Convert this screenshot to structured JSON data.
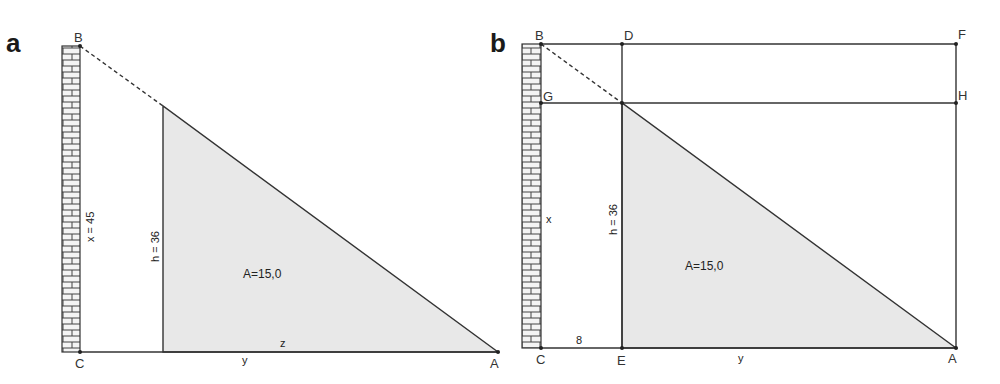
{
  "colors": {
    "background": "#ffffff",
    "line": "#333333",
    "shade": "#e8e8e8",
    "brick_fill": "#f4f4f4"
  },
  "panel_a": {
    "label": "a",
    "points": {
      "B": "B",
      "C": "C",
      "A": "A"
    },
    "dimensions": {
      "wall_height": "x = 45",
      "height": "h = 36",
      "base_left": "y",
      "base_right": "z"
    },
    "area": "A=15,0"
  },
  "panel_b": {
    "label": "b",
    "points": {
      "B": "B",
      "D": "D",
      "F": "F",
      "G": "G",
      "H": "H",
      "C": "C",
      "E": "E",
      "A": "A"
    },
    "dimensions": {
      "wall_height": "x",
      "height": "h = 36",
      "ce_length": "8",
      "base": "y"
    },
    "area": "A=15,0"
  }
}
